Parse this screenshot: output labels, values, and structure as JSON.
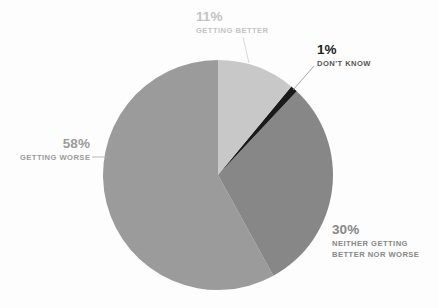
{
  "background_color": "#fdfdfd",
  "chart_data": {
    "type": "pie",
    "title": "",
    "subtitle": "",
    "xlabel": "",
    "ylabel": "",
    "legend_position": "callouts-around-pie",
    "grid": false,
    "total_percent": 100,
    "start_angle_deg": 0,
    "direction": "clockwise",
    "center": {
      "x": 218,
      "y": 175
    },
    "radius": 115,
    "categories": [
      "GETTING BETTER",
      "DON'T KNOW",
      "NEITHER GETTING BETTER NOR WORSE",
      "GETTING WORSE"
    ],
    "values": [
      11,
      1,
      30,
      58
    ],
    "colors": [
      "#c8c8c8",
      "#1a1a1a",
      "#878787",
      "#9b9b9b"
    ],
    "slices": [
      {
        "label": "GETTING BETTER",
        "value": 11,
        "value_text": "11%",
        "color": "#c8c8c8",
        "label_color": "#c3c3c3",
        "start_angle_deg": 0,
        "end_angle_deg": 39.6
      },
      {
        "label": "DON'T KNOW",
        "value": 1,
        "value_text": "1%",
        "color": "#1a1a1a",
        "label_color": "#1f1f1f",
        "start_angle_deg": 39.6,
        "end_angle_deg": 43.2
      },
      {
        "label": "NEITHER GETTING BETTER NOR WORSE",
        "value": 30,
        "value_text": "30%",
        "color": "#878787",
        "label_color": "#878787",
        "start_angle_deg": 43.2,
        "end_angle_deg": 151.2
      },
      {
        "label": "GETTING WORSE",
        "value": 58,
        "value_text": "58%",
        "color": "#9b9b9b",
        "label_color": "#9b9b9b",
        "start_angle_deg": 151.2,
        "end_angle_deg": 360
      }
    ]
  },
  "callouts": {
    "getting_better": {
      "percent": "11%",
      "category": "GETTING BETTER"
    },
    "dont_know": {
      "percent": "1%",
      "category": "DON'T KNOW"
    },
    "neither": {
      "percent": "30%",
      "category_line1": "NEITHER GETTING",
      "category_line2": "BETTER NOR WORSE"
    },
    "getting_worse": {
      "percent": "58%",
      "category": "GETTING WORSE"
    }
  }
}
